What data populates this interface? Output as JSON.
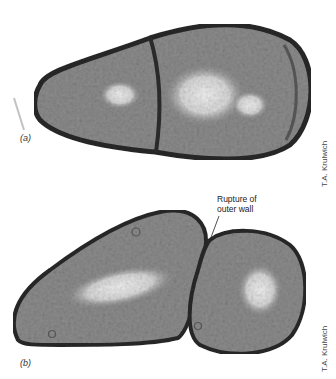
{
  "figure": {
    "panels": [
      {
        "label": "(a)",
        "credit": "T.A. Krulwich",
        "description": "Electron micrograph of a dividing bacterial cell with a completed septum"
      },
      {
        "label": "(b)",
        "credit": "T.A. Krulwich",
        "description": "Electron micrograph of two daughter cells separating",
        "annotation": {
          "line1": "Rupture of",
          "line2": "outer wall"
        }
      }
    ],
    "colors": {
      "cell_wall": "#2a2a2a",
      "cytoplasm": "#8a8a8a",
      "nucleoid": "#e0e0e0",
      "background": "#ffffff"
    }
  }
}
